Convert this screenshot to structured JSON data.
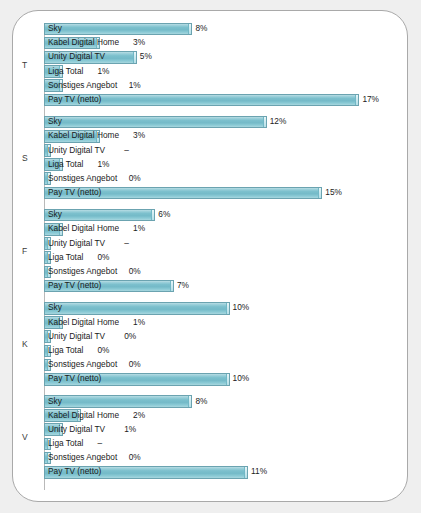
{
  "chart_data": {
    "type": "bar",
    "orientation": "horizontal",
    "title": "",
    "subtitle": "",
    "xlabel": "",
    "ylabel": "",
    "xlim": [
      0,
      18
    ],
    "grid": false,
    "legend": "none",
    "value_suffix": "%",
    "missing_symbol": "–",
    "categories": [
      "Sky",
      "Kabel Digital Home",
      "Unity Digital TV",
      "Liga Total",
      "Sonstiges Angebot",
      "Pay TV (netto)"
    ],
    "group_labels": [
      "T",
      "S",
      "F",
      "K",
      "V"
    ],
    "groups": [
      {
        "label": "T",
        "rows": [
          {
            "label": "Sky",
            "value": 8,
            "display": "8%"
          },
          {
            "label": "Kabel Digital Home",
            "value": 3,
            "display": "3%"
          },
          {
            "label": "Unity Digital TV",
            "value": 5,
            "display": "5%"
          },
          {
            "label": "Liga Total",
            "value": 1,
            "display": "1%"
          },
          {
            "label": "Sonstiges Angebot",
            "value": 1,
            "display": "1%"
          },
          {
            "label": "Pay TV (netto)",
            "value": 17,
            "display": "17%"
          }
        ]
      },
      {
        "label": "S",
        "rows": [
          {
            "label": "Sky",
            "value": 12,
            "display": "12%"
          },
          {
            "label": "Kabel Digital Home",
            "value": 3,
            "display": "3%"
          },
          {
            "label": "Unity Digital TV",
            "value": null,
            "display": "–"
          },
          {
            "label": "Liga Total",
            "value": 1,
            "display": "1%"
          },
          {
            "label": "Sonstiges Angebot",
            "value": 0,
            "display": "0%"
          },
          {
            "label": "Pay TV (netto)",
            "value": 15,
            "display": "15%"
          }
        ]
      },
      {
        "label": "F",
        "rows": [
          {
            "label": "Sky",
            "value": 6,
            "display": "6%"
          },
          {
            "label": "Kabel Digital Home",
            "value": 1,
            "display": "1%"
          },
          {
            "label": "Unity Digital TV",
            "value": null,
            "display": "–"
          },
          {
            "label": "Liga Total",
            "value": 0,
            "display": "0%"
          },
          {
            "label": "Sonstiges Angebot",
            "value": 0,
            "display": "0%"
          },
          {
            "label": "Pay TV (netto)",
            "value": 7,
            "display": "7%"
          }
        ]
      },
      {
        "label": "K",
        "rows": [
          {
            "label": "Sky",
            "value": 10,
            "display": "10%"
          },
          {
            "label": "Kabel Digital Home",
            "value": 1,
            "display": "1%"
          },
          {
            "label": "Unity Digital TV",
            "value": 0,
            "display": "0%"
          },
          {
            "label": "Liga Total",
            "value": 0,
            "display": "0%"
          },
          {
            "label": "Sonstiges Angebot",
            "value": 0,
            "display": "0%"
          },
          {
            "label": "Pay TV (netto)",
            "value": 10,
            "display": "10%"
          }
        ]
      },
      {
        "label": "V",
        "rows": [
          {
            "label": "Sky",
            "value": 8,
            "display": "8%"
          },
          {
            "label": "Kabel Digital Home",
            "value": 2,
            "display": "2%"
          },
          {
            "label": "Unity Digital TV",
            "value": 1,
            "display": "1%"
          },
          {
            "label": "Liga Total",
            "value": null,
            "display": "–"
          },
          {
            "label": "Sonstiges Angebot",
            "value": 0,
            "display": "0%"
          },
          {
            "label": "Pay TV (netto)",
            "value": 11,
            "display": "11%"
          }
        ]
      }
    ],
    "colors": {
      "bar_fill_light": "#b9dde4",
      "bar_fill_mid": "#7cc0cd",
      "bar_border": "#6ba3b0",
      "card_background": "#ffffff",
      "page_background": "#efefef",
      "card_border": "#a9a9a9",
      "text": "#1b1b1b"
    }
  }
}
